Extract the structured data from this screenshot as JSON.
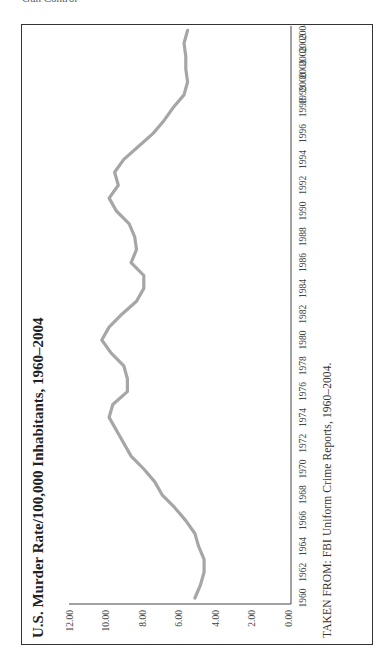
{
  "page": {
    "header_fragment": "Gun Control"
  },
  "figure": {
    "title": "U.S. Murder Rate/100,000 Inhabitants, 1960–2004",
    "caption": "TAKEN FROM: FBI Uniform Crime Reports, 1960–2004.",
    "line_color": "#a6a6a6",
    "frame_color": "#333333",
    "orientation": "rotated 90° counter-clockwise"
  },
  "chart_data": {
    "type": "line",
    "title": "U.S. Murder Rate/100,000 Inhabitants, 1960–2004",
    "xlabel": "",
    "ylabel": "",
    "ylim": [
      0,
      12
    ],
    "y_ticks": [
      "0.00",
      "2.00",
      "4.00",
      "6.00",
      "8.00",
      "10.00",
      "12.00"
    ],
    "x_tick_labels": [
      "1960",
      "1962",
      "1964",
      "1966",
      "1968",
      "1970",
      "1972",
      "1974",
      "1976",
      "1978",
      "1980",
      "1982",
      "1984",
      "1986",
      "1988",
      "1990",
      "1992",
      "1994",
      "1996",
      "1998",
      "1999",
      "2000",
      "2001",
      "2002",
      "2003",
      "2004"
    ],
    "grid": false,
    "legend": null,
    "source": "TAKEN FROM: FBI Uniform Crime Reports, 1960–2004.",
    "x": [
      1960,
      1961,
      1962,
      1963,
      1964,
      1965,
      1966,
      1967,
      1968,
      1969,
      1970,
      1971,
      1972,
      1973,
      1974,
      1975,
      1976,
      1977,
      1978,
      1979,
      1980,
      1981,
      1982,
      1983,
      1984,
      1985,
      1986,
      1987,
      1988,
      1989,
      1990,
      1991,
      1992,
      1993,
      1994,
      1995,
      1996,
      1997,
      1998,
      1999,
      2000,
      2001,
      2002,
      2003,
      2004
    ],
    "series": [
      {
        "name": "Murder rate per 100,000",
        "values": [
          5.1,
          4.8,
          4.6,
          4.6,
          4.9,
          5.1,
          5.6,
          6.2,
          6.9,
          7.3,
          7.9,
          8.6,
          9.0,
          9.4,
          9.8,
          9.6,
          8.8,
          8.8,
          9.0,
          9.7,
          10.2,
          9.8,
          9.1,
          8.3,
          7.9,
          7.9,
          8.6,
          8.3,
          8.4,
          8.7,
          9.4,
          9.8,
          9.3,
          9.5,
          9.0,
          8.2,
          7.4,
          6.8,
          6.3,
          5.7,
          5.5,
          5.6,
          5.6,
          5.7,
          5.5
        ]
      }
    ]
  }
}
